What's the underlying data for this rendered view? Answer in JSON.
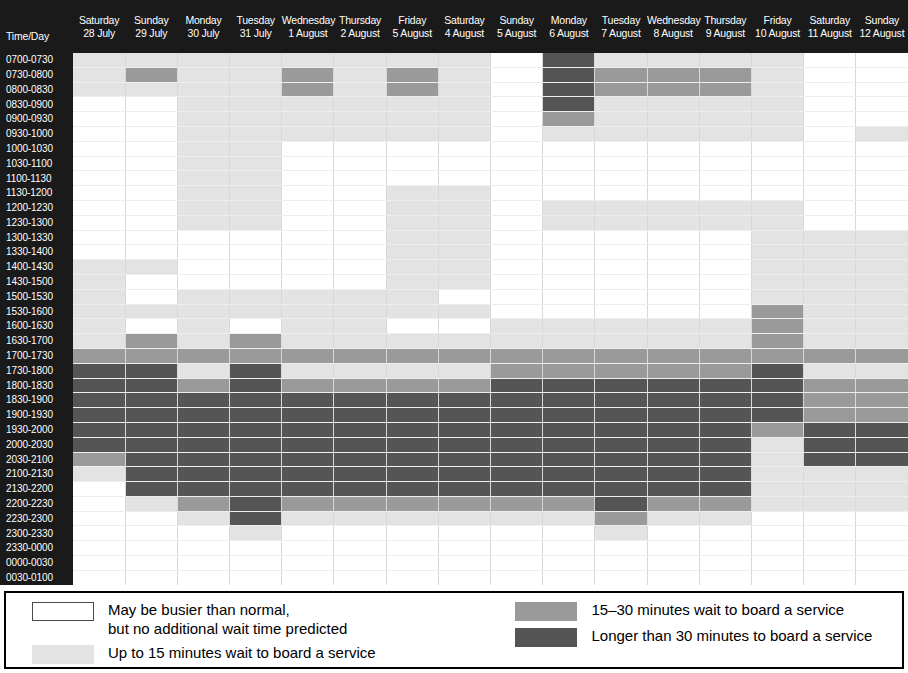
{
  "table": {
    "corner_label": "Time/Day",
    "days": [
      {
        "dow": "Saturday",
        "date": "28 July"
      },
      {
        "dow": "Sunday",
        "date": "29 July"
      },
      {
        "dow": "Monday",
        "date": "30 July"
      },
      {
        "dow": "Tuesday",
        "date": "31 July"
      },
      {
        "dow": "Wednesday",
        "date": "1 August"
      },
      {
        "dow": "Thursday",
        "date": "2 August"
      },
      {
        "dow": "Friday",
        "date": "5 August"
      },
      {
        "dow": "Saturday",
        "date": "4 August"
      },
      {
        "dow": "Sunday",
        "date": "5 August"
      },
      {
        "dow": "Monday",
        "date": "6 August"
      },
      {
        "dow": "Tuesday",
        "date": "7 August"
      },
      {
        "dow": "Wednesday",
        "date": "8 August"
      },
      {
        "dow": "Thursday",
        "date": "9 August"
      },
      {
        "dow": "Friday",
        "date": "10 August"
      },
      {
        "dow": "Saturday",
        "date": "11 August"
      },
      {
        "dow": "Sunday",
        "date": "12 August"
      }
    ],
    "times": [
      "0700-0730",
      "0730-0800",
      "0800-0830",
      "0830-0900",
      "0900-0930",
      "0930-1000",
      "1000-1030",
      "1030-1100",
      "1100-1130",
      "1130-1200",
      "1200-1230",
      "1230-1300",
      "1300-1330",
      "1330-1400",
      "1400-1430",
      "1430-1500",
      "1500-1530",
      "1530-1600",
      "1600-1630",
      "1630-1700",
      "1700-1730",
      "1730-1800",
      "1800-1830",
      "1830-1900",
      "1900-1930",
      "1930-2000",
      "2000-2030",
      "2030-2100",
      "2100-2130",
      "2130-2200",
      "2200-2230",
      "2230-2300",
      "2300-2330",
      "2330-0000",
      "0000-0030",
      "0030-0100"
    ]
  },
  "legend": {
    "items": [
      {
        "level": 0,
        "line1": "May be busier than normal,",
        "line2": "but no additional wait time predicted"
      },
      {
        "level": 1,
        "line1": "Up to 15 minutes wait to board a service",
        "line2": ""
      },
      {
        "level": 2,
        "line1": "15–30 minutes wait to board a service",
        "line2": ""
      },
      {
        "level": 3,
        "line1": "Longer than 30 minutes to board a service",
        "line2": ""
      }
    ]
  },
  "colors": {
    "level0": "#ffffff",
    "level1": "#e3e3e3",
    "level2": "#9a9a9a",
    "level3": "#555555",
    "header_background": "#1a1a1a",
    "header_text": "#ffffff"
  },
  "chart_data": {
    "type": "heatmap",
    "title": "",
    "xlabel": "Time/Day",
    "ylabel": "",
    "grid": true,
    "legend_position": "bottom",
    "value_scale": [
      {
        "value": 0,
        "label": "May be busier than normal, but no additional wait time predicted",
        "color": "#ffffff"
      },
      {
        "value": 1,
        "label": "Up to 15 minutes wait to board a service",
        "color": "#e3e3e3"
      },
      {
        "value": 2,
        "label": "15–30 minutes wait to board a service",
        "color": "#9a9a9a"
      },
      {
        "value": 3,
        "label": "Longer than 30 minutes to board a service",
        "color": "#555555"
      }
    ],
    "x_categories": [
      "Saturday 28 July",
      "Sunday 29 July",
      "Monday 30 July",
      "Tuesday 31 July",
      "Wednesday 1 August",
      "Thursday 2 August",
      "Friday 5 August",
      "Saturday 4 August",
      "Sunday 5 August",
      "Monday 6 August",
      "Tuesday 7 August",
      "Wednesday 8 August",
      "Thursday 9 August",
      "Friday 10 August",
      "Saturday 11 August",
      "Sunday 12 August"
    ],
    "y_categories": [
      "0700-0730",
      "0730-0800",
      "0800-0830",
      "0830-0900",
      "0900-0930",
      "0930-1000",
      "1000-1030",
      "1030-1100",
      "1100-1130",
      "1130-1200",
      "1200-1230",
      "1230-1300",
      "1300-1330",
      "1330-1400",
      "1400-1430",
      "1430-1500",
      "1500-1530",
      "1530-1600",
      "1600-1630",
      "1630-1700",
      "1700-1730",
      "1730-1800",
      "1800-1830",
      "1830-1900",
      "1900-1930",
      "1930-2000",
      "2000-2030",
      "2030-2100",
      "2100-2130",
      "2130-2200",
      "2200-2230",
      "2230-2300",
      "2300-2330",
      "2330-0000",
      "0000-0030",
      "0030-0100"
    ],
    "values": [
      [
        1,
        1,
        1,
        1,
        1,
        1,
        1,
        1,
        0,
        3,
        1,
        1,
        1,
        1,
        0,
        0
      ],
      [
        1,
        2,
        1,
        1,
        2,
        1,
        2,
        1,
        0,
        3,
        2,
        2,
        2,
        1,
        0,
        0
      ],
      [
        1,
        1,
        1,
        1,
        2,
        1,
        2,
        1,
        0,
        3,
        2,
        2,
        2,
        1,
        0,
        0
      ],
      [
        0,
        0,
        1,
        1,
        1,
        1,
        1,
        1,
        0,
        3,
        1,
        1,
        1,
        1,
        0,
        0
      ],
      [
        0,
        0,
        1,
        1,
        1,
        1,
        1,
        1,
        0,
        2,
        1,
        1,
        1,
        1,
        0,
        0
      ],
      [
        0,
        0,
        1,
        1,
        1,
        1,
        1,
        1,
        0,
        1,
        1,
        1,
        1,
        1,
        0,
        1
      ],
      [
        0,
        0,
        1,
        1,
        0,
        0,
        0,
        0,
        0,
        0,
        0,
        0,
        0,
        0,
        0,
        0
      ],
      [
        0,
        0,
        1,
        1,
        0,
        0,
        0,
        0,
        0,
        0,
        0,
        0,
        0,
        0,
        0,
        0
      ],
      [
        0,
        0,
        1,
        1,
        0,
        0,
        0,
        0,
        0,
        0,
        0,
        0,
        0,
        0,
        0,
        0
      ],
      [
        0,
        0,
        1,
        1,
        0,
        0,
        1,
        1,
        0,
        0,
        0,
        0,
        0,
        0,
        0,
        0
      ],
      [
        0,
        0,
        1,
        1,
        0,
        0,
        1,
        1,
        0,
        1,
        1,
        1,
        1,
        1,
        0,
        0
      ],
      [
        0,
        0,
        1,
        1,
        0,
        0,
        1,
        1,
        0,
        1,
        1,
        1,
        1,
        1,
        0,
        0
      ],
      [
        0,
        0,
        0,
        0,
        0,
        0,
        1,
        1,
        0,
        0,
        0,
        0,
        0,
        1,
        1,
        1
      ],
      [
        0,
        0,
        0,
        0,
        0,
        0,
        1,
        1,
        0,
        0,
        0,
        0,
        0,
        1,
        1,
        1
      ],
      [
        1,
        1,
        0,
        0,
        0,
        0,
        1,
        1,
        0,
        0,
        0,
        0,
        0,
        1,
        1,
        1
      ],
      [
        1,
        0,
        0,
        0,
        0,
        0,
        1,
        1,
        0,
        0,
        0,
        0,
        0,
        1,
        1,
        1
      ],
      [
        1,
        0,
        1,
        1,
        1,
        1,
        1,
        0,
        0,
        0,
        0,
        0,
        0,
        1,
        1,
        1
      ],
      [
        1,
        1,
        1,
        1,
        1,
        1,
        1,
        1,
        0,
        0,
        0,
        0,
        0,
        2,
        1,
        1
      ],
      [
        1,
        0,
        1,
        0,
        1,
        1,
        0,
        0,
        1,
        1,
        1,
        1,
        1,
        2,
        1,
        1
      ],
      [
        1,
        2,
        1,
        2,
        1,
        1,
        1,
        1,
        1,
        1,
        1,
        1,
        1,
        2,
        1,
        1
      ],
      [
        2,
        2,
        2,
        2,
        2,
        2,
        2,
        2,
        2,
        2,
        2,
        2,
        2,
        2,
        2,
        2
      ],
      [
        3,
        3,
        1,
        3,
        1,
        1,
        1,
        1,
        2,
        2,
        2,
        2,
        2,
        3,
        1,
        1
      ],
      [
        3,
        3,
        2,
        3,
        2,
        2,
        2,
        2,
        3,
        3,
        3,
        3,
        3,
        3,
        2,
        2
      ],
      [
        3,
        3,
        3,
        3,
        3,
        3,
        3,
        3,
        3,
        3,
        3,
        3,
        3,
        3,
        2,
        2
      ],
      [
        3,
        3,
        3,
        3,
        3,
        3,
        3,
        3,
        3,
        3,
        3,
        3,
        3,
        3,
        2,
        2
      ],
      [
        3,
        3,
        3,
        3,
        3,
        3,
        3,
        3,
        3,
        3,
        3,
        3,
        3,
        2,
        3,
        3
      ],
      [
        3,
        3,
        3,
        3,
        3,
        3,
        3,
        3,
        3,
        3,
        3,
        3,
        3,
        1,
        3,
        3
      ],
      [
        2,
        3,
        3,
        3,
        3,
        3,
        3,
        3,
        3,
        3,
        3,
        3,
        3,
        1,
        3,
        3
      ],
      [
        1,
        3,
        3,
        3,
        3,
        3,
        3,
        3,
        3,
        3,
        3,
        3,
        3,
        1,
        1,
        1
      ],
      [
        0,
        3,
        3,
        3,
        3,
        3,
        3,
        3,
        3,
        3,
        3,
        3,
        3,
        1,
        1,
        1
      ],
      [
        0,
        1,
        2,
        3,
        2,
        2,
        2,
        2,
        2,
        2,
        3,
        2,
        2,
        1,
        1,
        1
      ],
      [
        0,
        0,
        1,
        3,
        1,
        1,
        1,
        1,
        1,
        1,
        2,
        1,
        1,
        0,
        0,
        0
      ],
      [
        0,
        0,
        0,
        1,
        0,
        0,
        0,
        0,
        0,
        0,
        1,
        0,
        0,
        0,
        0,
        0
      ],
      [
        0,
        0,
        0,
        0,
        0,
        0,
        0,
        0,
        0,
        0,
        0,
        0,
        0,
        0,
        0,
        0
      ],
      [
        0,
        0,
        0,
        0,
        0,
        0,
        0,
        0,
        0,
        0,
        0,
        0,
        0,
        0,
        0,
        0
      ],
      [
        0,
        0,
        0,
        0,
        0,
        0,
        0,
        0,
        0,
        0,
        0,
        0,
        0,
        0,
        0,
        0
      ]
    ]
  }
}
